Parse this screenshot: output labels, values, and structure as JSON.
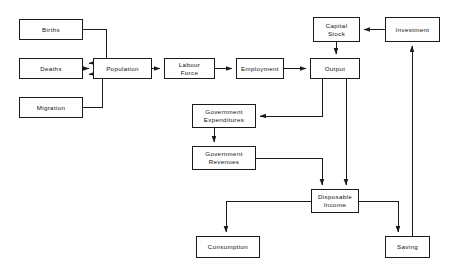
{
  "diagram": {
    "type": "flowchart",
    "background_color": "#ffffff",
    "line_color": "#1a1a1a",
    "box_fill_color": "#ffffff",
    "nodes": [
      {
        "id": "births",
        "label": "Births",
        "x": 19,
        "y": 19,
        "w": 64,
        "h": 21
      },
      {
        "id": "deaths",
        "label": "Deaths",
        "x": 19,
        "y": 58,
        "w": 64,
        "h": 21
      },
      {
        "id": "migration",
        "label": "Migration",
        "x": 19,
        "y": 97,
        "w": 64,
        "h": 21
      },
      {
        "id": "population",
        "label": "Population",
        "x": 93,
        "y": 58,
        "w": 59,
        "h": 21
      },
      {
        "id": "labour_force",
        "label": "Labour\nForce",
        "x": 164,
        "y": 58,
        "w": 51,
        "h": 21
      },
      {
        "id": "employment",
        "label": "Employment",
        "x": 236,
        "y": 58,
        "w": 48,
        "h": 21
      },
      {
        "id": "output",
        "label": "Output",
        "x": 310,
        "y": 58,
        "w": 50,
        "h": 21
      },
      {
        "id": "capital_stock",
        "label": "Capital\nStock",
        "x": 313,
        "y": 17,
        "w": 47,
        "h": 25
      },
      {
        "id": "investment",
        "label": "Investment",
        "x": 385,
        "y": 17,
        "w": 55,
        "h": 25
      },
      {
        "id": "gov_expend",
        "label": "Government\nExpenditures",
        "x": 192,
        "y": 104,
        "w": 64,
        "h": 24
      },
      {
        "id": "gov_revenues",
        "label": "Government\nRevenues",
        "x": 192,
        "y": 146,
        "w": 64,
        "h": 24
      },
      {
        "id": "disposable",
        "label": "Disposable\nIncome",
        "x": 311,
        "y": 189,
        "w": 48,
        "h": 24
      },
      {
        "id": "consumption",
        "label": "Consumption",
        "x": 196,
        "y": 236,
        "w": 64,
        "h": 22
      },
      {
        "id": "saving",
        "label": "Saving",
        "x": 385,
        "y": 236,
        "w": 45,
        "h": 22
      }
    ],
    "edges": [
      {
        "from": "births",
        "to": "population",
        "label": ""
      },
      {
        "from": "deaths",
        "to": "population",
        "label": ""
      },
      {
        "from": "migration",
        "to": "population",
        "label": ""
      },
      {
        "from": "population",
        "to": "labour_force",
        "label": ""
      },
      {
        "from": "labour_force",
        "to": "employment",
        "label": ""
      },
      {
        "from": "employment",
        "to": "output",
        "label": ""
      },
      {
        "from": "investment",
        "to": "capital_stock",
        "label": ""
      },
      {
        "from": "capital_stock",
        "to": "output",
        "label": ""
      },
      {
        "from": "output",
        "to": "gov_expend",
        "label": ""
      },
      {
        "from": "output",
        "to": "disposable",
        "label": ""
      },
      {
        "from": "gov_expend",
        "to": "gov_revenues",
        "label": ""
      },
      {
        "from": "gov_revenues",
        "to": "disposable",
        "label": ""
      },
      {
        "from": "disposable",
        "to": "consumption",
        "label": ""
      },
      {
        "from": "disposable",
        "to": "saving",
        "label": ""
      },
      {
        "from": "saving",
        "to": "investment",
        "label": ""
      }
    ]
  }
}
